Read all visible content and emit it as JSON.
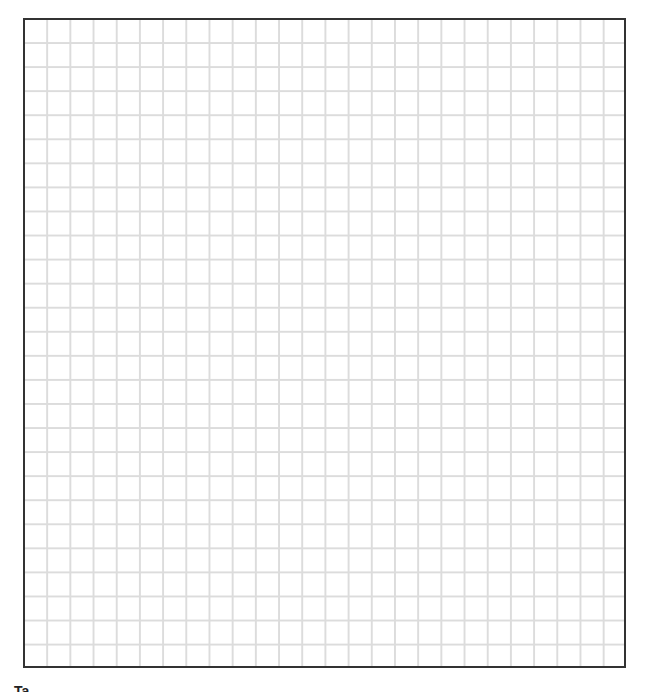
{
  "grid": {
    "columns": 26,
    "rows": 27,
    "line_color": "#dcdcdc",
    "border_color": "#333333",
    "background_color": "#ffffff"
  },
  "caption": {
    "text": "Ta..."
  }
}
